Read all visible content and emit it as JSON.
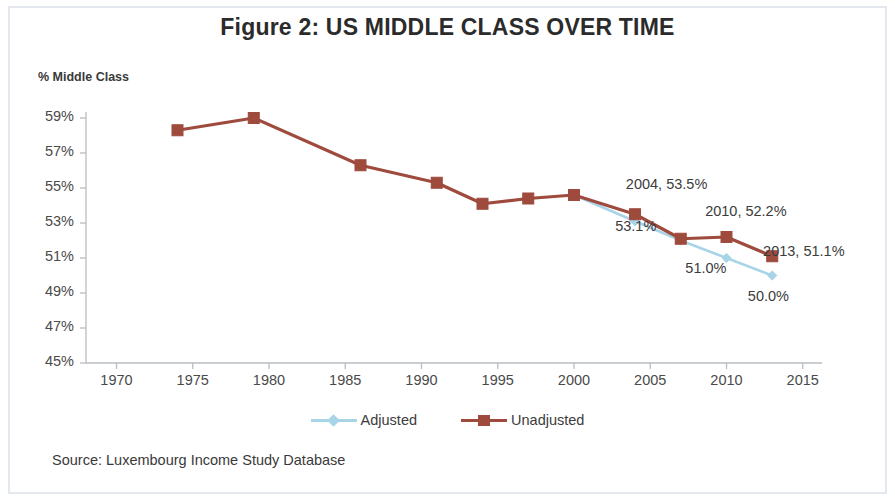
{
  "figure": {
    "title": "Figure 2: US MIDDLE CLASS OVER TIME",
    "source_note": "Source: Luxembourg Income Study Database"
  },
  "chart_data": {
    "type": "line",
    "title": "Figure 2: US MIDDLE CLASS OVER TIME",
    "xlabel": "",
    "ylabel": "% Middle Class",
    "xlim": [
      1968,
      2016
    ],
    "ylim": [
      45,
      59
    ],
    "ytick_labels": [
      "59%",
      "57%",
      "55%",
      "53%",
      "51%",
      "49%",
      "47%",
      "45%"
    ],
    "ytick_values": [
      59,
      57,
      55,
      53,
      51,
      49,
      47,
      45
    ],
    "xtick_labels": [
      "1970",
      "1975",
      "1980",
      "1985",
      "1990",
      "1995",
      "2000",
      "2005",
      "2010",
      "2015"
    ],
    "xtick_values": [
      1970,
      1975,
      1980,
      1985,
      1990,
      1995,
      2000,
      2005,
      2010,
      2015
    ],
    "grid": false,
    "legend_position": "bottom",
    "series": [
      {
        "name": "Unadjusted",
        "color": "#9E4A3C",
        "marker": "square",
        "x": [
          1974,
          1979,
          1986,
          1991,
          1994,
          1997,
          2000,
          2004,
          2007,
          2010,
          2013
        ],
        "y": [
          58.3,
          59.0,
          56.3,
          55.3,
          54.1,
          54.4,
          54.6,
          53.5,
          52.1,
          52.2,
          51.1
        ]
      },
      {
        "name": "Adjusted",
        "color": "#A8D4E8",
        "marker": "diamond",
        "x": [
          2000,
          2004,
          2007,
          2010,
          2013
        ],
        "y": [
          54.6,
          53.1,
          52.0,
          51.0,
          50.0
        ]
      }
    ],
    "annotations": [
      {
        "text": "2004, 53.5%",
        "x": 2003.4,
        "y": 55.1
      },
      {
        "text": "53.1%",
        "x": 2002.7,
        "y": 52.7
      },
      {
        "text": "2010, 52.2%",
        "x": 2008.6,
        "y": 53.6
      },
      {
        "text": "51.0%",
        "x": 2007.3,
        "y": 50.3
      },
      {
        "text": "2013, 51.1%",
        "x": 2012.4,
        "y": 51.3
      },
      {
        "text": "50.0%",
        "x": 2011.4,
        "y": 48.7
      }
    ]
  },
  "legend": {
    "entries": [
      {
        "label": "Adjusted"
      },
      {
        "label": "Unadjusted"
      }
    ]
  },
  "axis": {
    "y_title": "% Middle Class"
  }
}
